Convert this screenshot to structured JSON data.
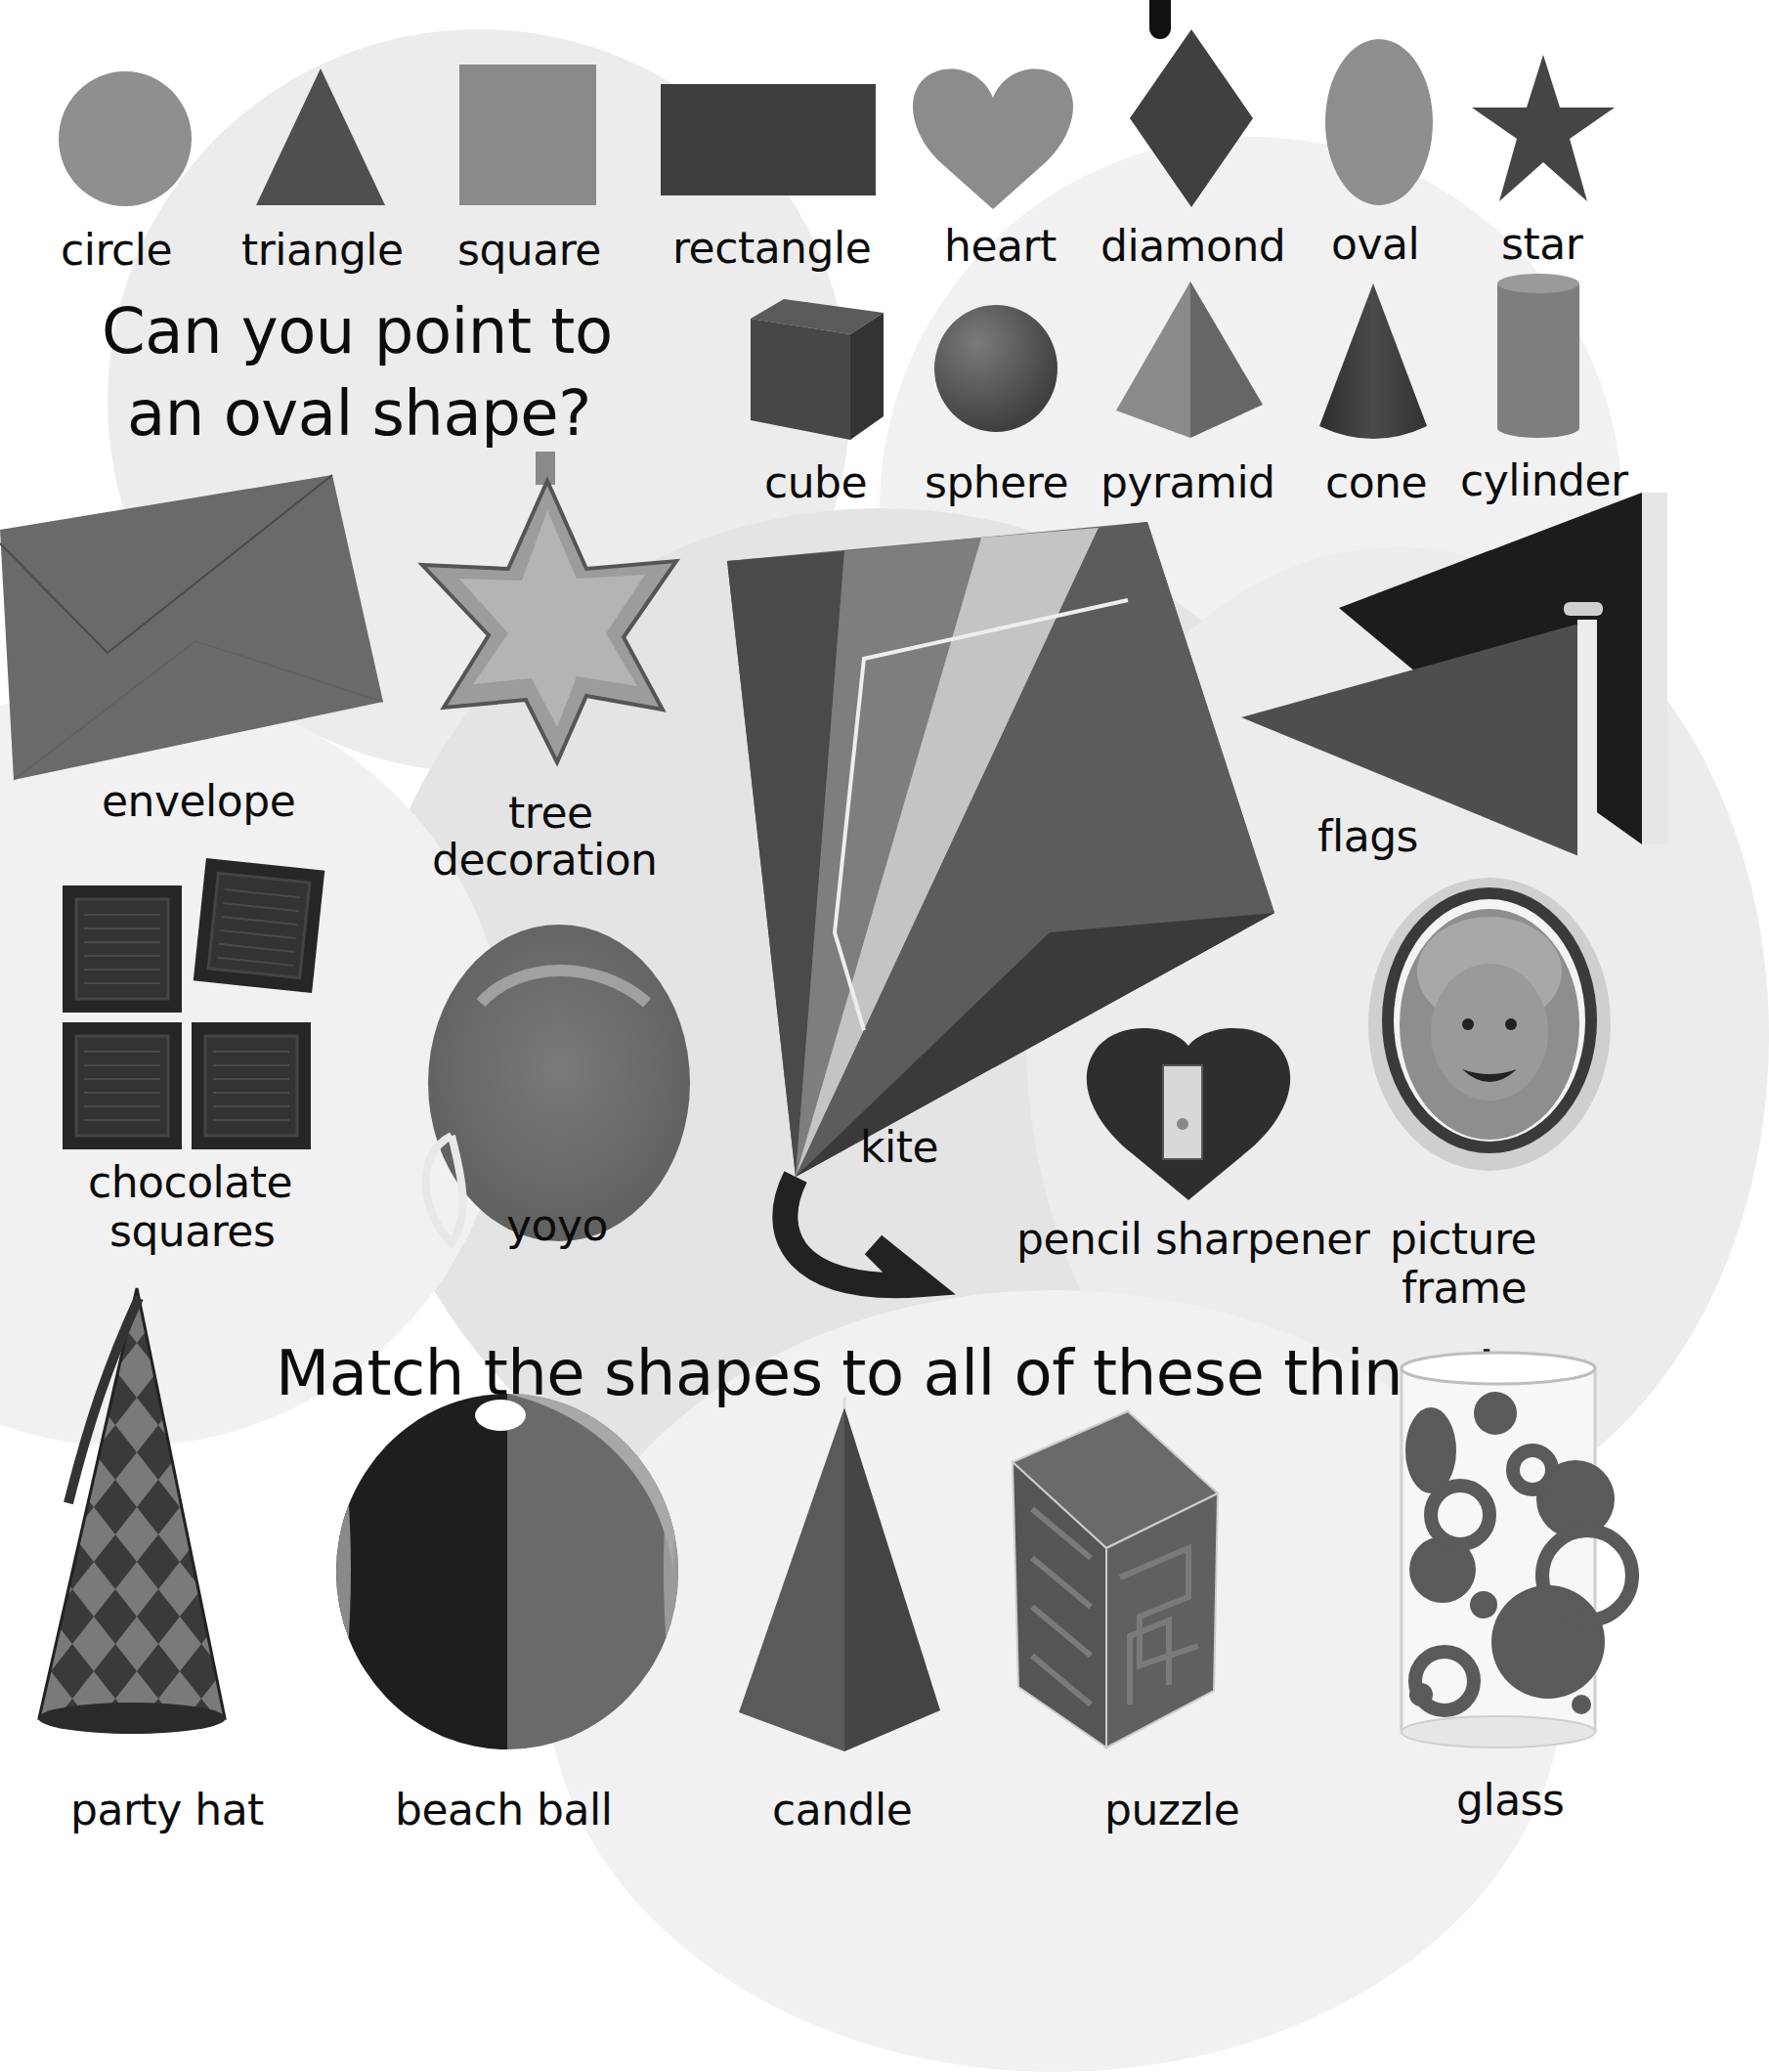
{
  "page": {
    "background": "#ffffff",
    "circle_tint": "#e9e9e9"
  },
  "flat_shapes": [
    {
      "label": "circle",
      "shape": "circle-icon",
      "color": "#8f8f8f"
    },
    {
      "label": "triangle",
      "shape": "triangle-icon",
      "color": "#4f4f4f"
    },
    {
      "label": "square",
      "shape": "square-icon",
      "color": "#8a8a8a"
    },
    {
      "label": "rectangle",
      "shape": "rectangle-icon",
      "color": "#3e3e3e"
    },
    {
      "label": "heart",
      "shape": "heart-icon",
      "color": "#8c8c8c"
    },
    {
      "label": "diamond",
      "shape": "diamond-icon",
      "color": "#404040"
    },
    {
      "label": "oval",
      "shape": "oval-icon",
      "color": "#8e8e8e"
    },
    {
      "label": "star",
      "shape": "star-icon",
      "color": "#454545"
    }
  ],
  "solid_shapes": [
    {
      "label": "cube",
      "shape": "cube-icon",
      "color": "#4a4a4a"
    },
    {
      "label": "sphere",
      "shape": "sphere-icon",
      "color": "#5a5a5a"
    },
    {
      "label": "pyramid",
      "shape": "pyramid-icon",
      "color": "#7a7a7a"
    },
    {
      "label": "cone",
      "shape": "cone-icon",
      "color": "#3f3f3f"
    },
    {
      "label": "cylinder",
      "shape": "cylinder-icon",
      "color": "#848484"
    }
  ],
  "prompts": {
    "question_line1": "Can you point to",
    "question_line2": "an oval shape?",
    "instruction": "Match the shapes to all of these things!"
  },
  "objects": [
    {
      "label": "envelope",
      "icon": "envelope-icon"
    },
    {
      "label_line1": "tree",
      "label_line2": "decoration",
      "icon": "star-ornament-icon"
    },
    {
      "label": "kite",
      "icon": "kite-icon"
    },
    {
      "label": "flags",
      "icon": "flags-icon"
    },
    {
      "label_line1": "chocolate",
      "label_line2": "squares",
      "icon": "chocolate-icon"
    },
    {
      "label": "yoyo",
      "icon": "yoyo-icon"
    },
    {
      "label": "pencil sharpener",
      "icon": "heart-sharpener-icon"
    },
    {
      "label_line1": "picture",
      "label_line2": "frame",
      "icon": "oval-frame-icon"
    },
    {
      "label": "party hat",
      "icon": "party-hat-icon"
    },
    {
      "label": "beach ball",
      "icon": "beach-ball-icon"
    },
    {
      "label": "candle",
      "icon": "pyramid-candle-icon"
    },
    {
      "label": "puzzle",
      "icon": "maze-cube-icon"
    },
    {
      "label": "glass",
      "icon": "glass-icon"
    }
  ]
}
